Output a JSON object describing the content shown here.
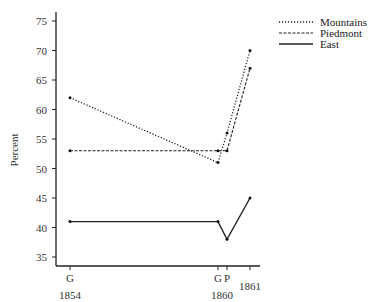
{
  "chart_data": {
    "type": "line",
    "title": "",
    "xlabel": "",
    "ylabel": "Percent",
    "ylim": [
      33,
      76
    ],
    "yticks": [
      35,
      40,
      45,
      50,
      55,
      60,
      65,
      70,
      75
    ],
    "x_ticks": [
      {
        "key": "G1854",
        "top": "G",
        "bottom": "1854"
      },
      {
        "key": "G1860",
        "top": "G",
        "bottom": ""
      },
      {
        "key": "P1860",
        "top": "P",
        "bottom": "1860"
      },
      {
        "key": "1861",
        "top": "",
        "bottom": "1861"
      }
    ],
    "categories": [
      "G 1854",
      "G 1860",
      "P 1860",
      "1861"
    ],
    "series": [
      {
        "name": "Mountains",
        "style": "dotted",
        "values": [
          62,
          51,
          56,
          70
        ]
      },
      {
        "name": "Piedmont",
        "style": "dashed",
        "values": [
          53,
          53,
          53,
          67
        ]
      },
      {
        "name": "East",
        "style": "solid",
        "values": [
          41,
          41,
          38,
          45
        ]
      }
    ],
    "legend_position": "top-right",
    "grid": false
  },
  "legend": {
    "items": [
      {
        "label": "Mountains"
      },
      {
        "label": "Piedmont"
      },
      {
        "label": "East"
      }
    ]
  },
  "axis": {
    "ylabel": "Percent",
    "yticks": [
      "35",
      "40",
      "45",
      "50",
      "55",
      "60",
      "65",
      "70",
      "75"
    ],
    "xticks_top": [
      "G",
      "G",
      "P",
      ""
    ],
    "xticks_bottom": [
      "1854",
      "",
      "1860",
      "1861"
    ]
  }
}
